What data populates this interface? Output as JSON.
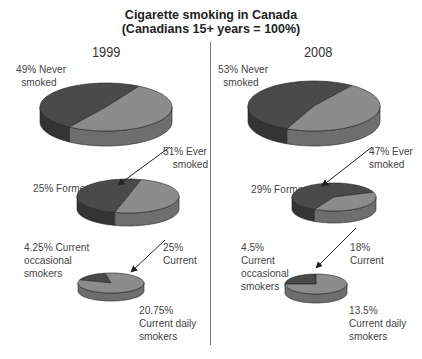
{
  "title": "Cigarette smoking in Canada",
  "subtitle": "(Canadians 15+ years = 100%)",
  "colors": {
    "dark_top": "#4a4a4a",
    "dark_side": "#343434",
    "light_top": "#8c8c8c",
    "light_side": "#6e6e6e",
    "outline": "#222222"
  },
  "panels": [
    {
      "year": "1999",
      "labels": {
        "never": [
          "49% Never",
          "smoked"
        ],
        "ever": [
          "51% Ever",
          "smoked"
        ],
        "former": [
          "25% Former"
        ],
        "occasional": [
          "4.25% Current",
          "occasional",
          "smokers"
        ],
        "current": [
          "25%",
          "Current"
        ],
        "daily": [
          "20.75%",
          "Current daily",
          "smokers"
        ]
      }
    },
    {
      "year": "2008",
      "labels": {
        "never": [
          "53% Never",
          "smoked"
        ],
        "ever": [
          "47% Ever",
          "smoked"
        ],
        "former": [
          "29% Former"
        ],
        "occasional": [
          "4.5%",
          "Current",
          "occasional",
          "smokers"
        ],
        "current": [
          "18%",
          "Current"
        ],
        "daily": [
          "13.5%",
          "Current daily",
          "smokers"
        ]
      }
    }
  ],
  "chart_data": [
    {
      "type": "pie",
      "title": "1999 - Canadians 15+ years",
      "categories": [
        "Never smoked",
        "Ever smoked"
      ],
      "values": [
        49,
        51
      ],
      "unit": "%"
    },
    {
      "type": "pie",
      "title": "1999 - Ever smoked breakdown",
      "categories": [
        "Former",
        "Current"
      ],
      "values": [
        25,
        25
      ],
      "unit": "%"
    },
    {
      "type": "pie",
      "title": "1999 - Current smokers breakdown",
      "categories": [
        "Current occasional smokers",
        "Current daily smokers"
      ],
      "values": [
        4.25,
        20.75
      ],
      "unit": "%"
    },
    {
      "type": "pie",
      "title": "2008 - Canadians 15+ years",
      "categories": [
        "Never smoked",
        "Ever smoked"
      ],
      "values": [
        53,
        47
      ],
      "unit": "%"
    },
    {
      "type": "pie",
      "title": "2008 - Ever smoked breakdown",
      "categories": [
        "Former",
        "Current"
      ],
      "values": [
        29,
        18
      ],
      "unit": "%"
    },
    {
      "type": "pie",
      "title": "2008 - Current smokers breakdown",
      "categories": [
        "Current occasional smokers",
        "Current daily smokers"
      ],
      "values": [
        4.5,
        13.5
      ],
      "unit": "%"
    }
  ]
}
